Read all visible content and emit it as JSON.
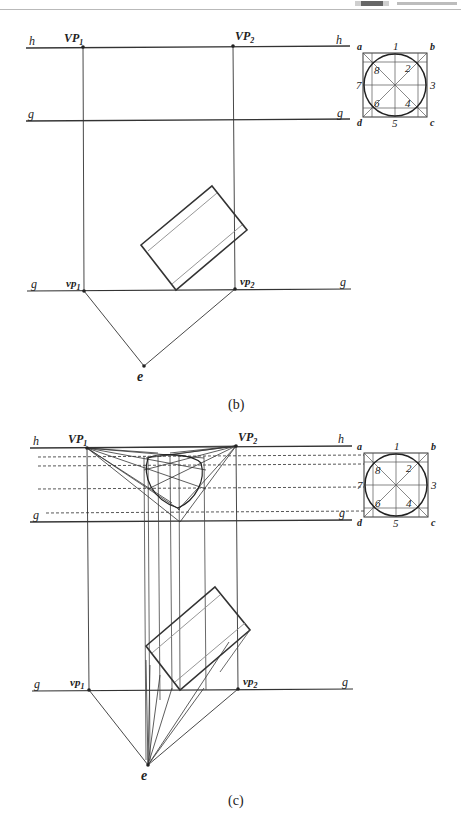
{
  "figure_b": {
    "caption": "(b)",
    "labels": {
      "h_left": "h",
      "h_right": "h",
      "g_upper_left": "g",
      "g_upper_right": "g",
      "g_lower_left": "g",
      "g_lower_right": "g",
      "VP1": "VP",
      "VP1_sub": "1",
      "VP2": "VP",
      "VP2_sub": "2",
      "vp1": "vp",
      "vp1_sub": "1",
      "vp2": "vp",
      "vp2_sub": "2",
      "e": "e"
    },
    "circle_key": {
      "corners": [
        "a",
        "b",
        "c",
        "d"
      ],
      "points": [
        "1",
        "2",
        "3",
        "4",
        "5",
        "6",
        "7",
        "8"
      ]
    }
  },
  "figure_c": {
    "caption": "(c)",
    "labels": {
      "h_left": "h",
      "h_right": "h",
      "g_upper_left": "g",
      "g_upper_right": "g",
      "g_lower_left": "g",
      "g_lower_right": "g",
      "VP1": "VP",
      "VP1_sub": "1",
      "VP2": "VP",
      "VP2_sub": "2",
      "vp1": "vp",
      "vp1_sub": "1",
      "vp2": "vp",
      "vp2_sub": "2",
      "e": "e"
    },
    "circle_key": {
      "corners": [
        "a",
        "b",
        "c",
        "d"
      ],
      "points": [
        "1",
        "2",
        "3",
        "4",
        "5",
        "6",
        "7",
        "8"
      ]
    }
  },
  "colors": {
    "line": "#333333",
    "thin_line": "#555555",
    "inner_line": "#8a8a8a",
    "background": "#ffffff"
  }
}
